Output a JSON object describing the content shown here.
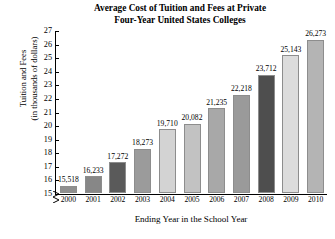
{
  "chart_data": {
    "type": "bar",
    "title": "Average Cost of Tuition and Fees at Private Four-Year United States Colleges",
    "title_lines": [
      "Average Cost of Tuition and Fees at Private",
      "Four-Year United States Colleges"
    ],
    "xlabel": "Ending Year in the School Year",
    "ylabel": "Tuition and Fees (in thousands of dollars)",
    "ylabel_lines": [
      "Tuition and Fees",
      "(in thousands of dollars)"
    ],
    "categories": [
      "2000",
      "2001",
      "2002",
      "2003",
      "2004",
      "2005",
      "2006",
      "2007",
      "2008",
      "2009",
      "2010"
    ],
    "values": [
      15518,
      16233,
      17272,
      18273,
      19710,
      20082,
      21235,
      22218,
      23712,
      25143,
      26273
    ],
    "value_labels": [
      "15,518",
      "16,233",
      "17,272",
      "18,273",
      "19,710",
      "20,082",
      "21,235",
      "22,218",
      "23,712",
      "25,143",
      "26,273"
    ],
    "bar_colors": [
      "#8f8f8f",
      "#878787",
      "#5a5a5a",
      "#9b9b9b",
      "#d3d3d3",
      "#c2c2c2",
      "#a8a8a8",
      "#9a9a9a",
      "#4e4e4e",
      "#dcdcdc",
      "#b4b4b4"
    ],
    "ylim": [
      15,
      27
    ],
    "yticks": [
      15,
      16,
      17,
      18,
      19,
      20,
      21,
      22,
      23,
      24,
      25,
      26,
      27
    ],
    "ytick_labels": [
      "15",
      "16",
      "17",
      "18",
      "19",
      "20",
      "21",
      "22",
      "23",
      "24",
      "25",
      "26",
      "27"
    ],
    "y_unit": "thousands of dollars",
    "axis_break": true,
    "grid": false,
    "legend": "none"
  }
}
